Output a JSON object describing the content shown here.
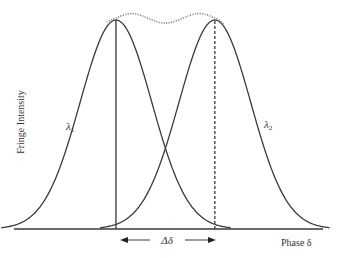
{
  "diagram": {
    "y_axis_label": "Fringe Intensity",
    "x_axis_label": "Phase δ",
    "curve1_label": "λ",
    "curve1_subscript": "1",
    "curve2_label": "λ",
    "curve2_subscript": "2",
    "shift_label": "Δδ",
    "colors": {
      "curve": "#3a3a3a",
      "envelope": "#8a8a8a",
      "axis": "#3a3a3a"
    }
  },
  "chart_data": {
    "type": "line",
    "title": "",
    "xlabel": "Phase δ",
    "ylabel": "Fringe Intensity",
    "xlim": [
      0,
      10
    ],
    "ylim": [
      0,
      1.05
    ],
    "series": [
      {
        "name": "λ1",
        "style": "solid",
        "peak_x": 3.3,
        "peak_y": 1.0,
        "sigma": 1.16
      },
      {
        "name": "λ2",
        "style": "solid",
        "peak_x": 6.5,
        "peak_y": 1.0,
        "sigma": 1.16
      },
      {
        "name": "envelope",
        "style": "dotted",
        "points": [
          [
            3.0,
            0.99
          ],
          [
            3.3,
            1.01
          ],
          [
            3.9,
            1.03
          ],
          [
            4.9,
            0.985
          ],
          [
            5.9,
            1.03
          ],
          [
            6.5,
            1.01
          ],
          [
            6.8,
            0.98
          ]
        ]
      }
    ],
    "markers": [
      {
        "x": 3.3,
        "style": "solid"
      },
      {
        "x": 6.5,
        "style": "dashed"
      }
    ],
    "annotation": {
      "text": "Δδ",
      "from_x": 3.3,
      "to_x": 6.5
    }
  }
}
